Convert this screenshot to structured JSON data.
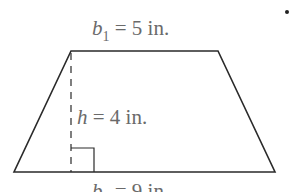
{
  "diagram": {
    "shape": "trapezoid",
    "top_base": {
      "var": "b",
      "sub": "1",
      "eq": " = 5 in."
    },
    "height": {
      "var": "h",
      "eq": " = 4 in."
    },
    "bottom_base": {
      "var": "b",
      "sub": "2",
      "eq": " = 9 in."
    },
    "colors": {
      "line": "#2a2a2a",
      "text": "#6a6a6a"
    }
  }
}
